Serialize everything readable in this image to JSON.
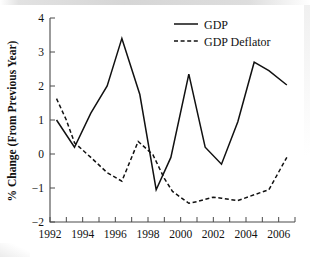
{
  "chart_data": {
    "type": "line",
    "title": "",
    "xlabel": "",
    "ylabel": "% Change (From Previous Year)",
    "xlim": [
      1992,
      2007
    ],
    "ylim": [
      -2,
      4
    ],
    "yticks": [
      "4",
      "3",
      "2",
      "1",
      "0",
      "−1",
      "−2"
    ],
    "ytick_values": [
      4,
      3,
      2,
      1,
      0,
      -1,
      -2
    ],
    "xticks": [
      "1992",
      "1994",
      "1996",
      "1998",
      "2000",
      "2002",
      "2004",
      "2006"
    ],
    "xtick_values": [
      1992,
      1994,
      1996,
      1998,
      2000,
      2002,
      2004,
      2006
    ],
    "xminor_step": 1,
    "grid": false,
    "legend_position": "top-right",
    "series": [
      {
        "name": "GDP",
        "style": "solid",
        "color": "#111111",
        "x": [
          1992.4,
          1993.5,
          1994.5,
          1995.5,
          1996.4,
          1997.5,
          1998.5,
          1999.4,
          2000.5,
          2001.5,
          2002.5,
          2003.5,
          2004.5,
          2005.4,
          2006.5
        ],
        "values": [
          1.0,
          0.2,
          1.2,
          2.0,
          3.4,
          1.75,
          -1.05,
          -0.1,
          2.35,
          0.2,
          -0.3,
          0.95,
          2.7,
          2.45,
          2.03
        ]
      },
      {
        "name": "GDP Deflator",
        "style": "dashed",
        "color": "#111111",
        "x": [
          1992.4,
          1993.0,
          1993.5,
          1994.5,
          1995.5,
          1996.4,
          1997.4,
          1998.3,
          1999.0,
          1999.5,
          2000.5,
          2001.0,
          2002.0,
          2002.5,
          2003.5,
          2004.5,
          2005.4,
          2006.5
        ],
        "values": [
          1.63,
          1.0,
          0.33,
          -0.1,
          -0.55,
          -0.8,
          0.37,
          -0.02,
          -0.72,
          -1.1,
          -1.45,
          -1.4,
          -1.27,
          -1.3,
          -1.37,
          -1.2,
          -1.05,
          -0.1
        ]
      }
    ],
    "legend": [
      {
        "label": "GDP",
        "style": "solid"
      },
      {
        "label": "GDP Deflator",
        "style": "dashed"
      }
    ]
  }
}
